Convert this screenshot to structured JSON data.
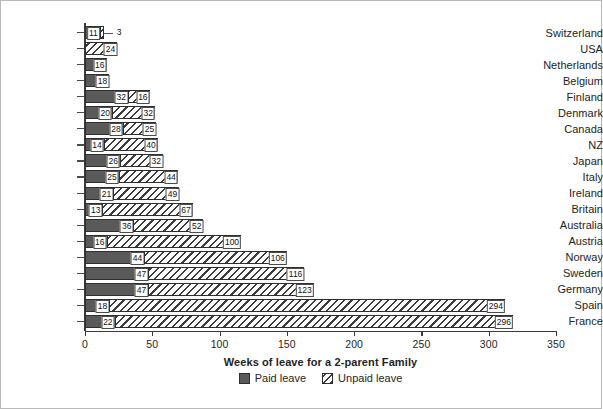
{
  "chart_data": {
    "type": "bar",
    "orientation": "horizontal",
    "stacked": true,
    "title": "",
    "xlabel": "Weeks of leave for a 2-parent Family",
    "ylabel": "",
    "xlim": [
      0,
      350
    ],
    "xticks": [
      0,
      50,
      100,
      150,
      200,
      250,
      300,
      350
    ],
    "grid": false,
    "legend_position": "bottom",
    "categories": [
      "Switzerland",
      "USA",
      "Netherlands",
      "Belgium",
      "Finland",
      "Denmark",
      "Canada",
      "NZ",
      "Japan",
      "Italy",
      "Ireland",
      "Britain",
      "Australia",
      "Austria",
      "Norway",
      "Sweden",
      "Germany",
      "Spain",
      "France"
    ],
    "series": [
      {
        "name": "Paid leave",
        "color": "#5a5a5a",
        "pattern": "solid",
        "values": [
          11,
          0,
          16,
          18,
          32,
          20,
          28,
          14,
          26,
          25,
          21,
          13,
          36,
          16,
          44,
          47,
          47,
          18,
          22
        ]
      },
      {
        "name": "Unpaid leave",
        "color": "#ffffff",
        "pattern": "diagonal-hatch",
        "values": [
          3,
          24,
          0,
          0,
          16,
          32,
          25,
          40,
          32,
          44,
          49,
          67,
          52,
          100,
          106,
          116,
          123,
          294,
          296
        ]
      }
    ],
    "annotations": [
      {
        "category": "Switzerland",
        "text": "3",
        "style": "leader-line-outside"
      }
    ]
  },
  "legend": {
    "items": [
      {
        "label": "Paid leave",
        "swatch": "paid-swatch"
      },
      {
        "label": "Unpaid leave",
        "swatch": "unpaid-swatch"
      }
    ]
  }
}
